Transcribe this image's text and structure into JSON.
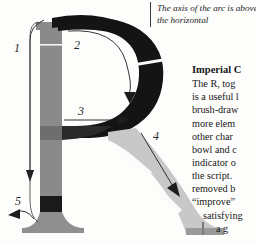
{
  "page": {
    "background_color": "#fdfdfc"
  },
  "colors": {
    "stem_gray": "#8a8a8a",
    "bowl_black": "#141414",
    "leg_light_gray": "#c8c8c8",
    "leg_mid_gray": "#b4b4b4",
    "foot_gray": "#9a9a9a",
    "outline": "#3a3a3a",
    "text": "#171717"
  },
  "caption": {
    "lines": [
      "The axis of the arc is above",
      "the horizontal"
    ]
  },
  "article": {
    "heading": "Imperial C",
    "lines": [
      {
        "text": "The R, tog",
        "indent": 0
      },
      {
        "text": "is a useful l",
        "indent": 0
      },
      {
        "text": "brush-draw",
        "indent": 0
      },
      {
        "text": "more elem",
        "indent": 0
      },
      {
        "text": "other char",
        "indent": 0
      },
      {
        "text": "bowl and c",
        "indent": 0
      },
      {
        "text": "indicator o",
        "indent": 0
      },
      {
        "text": "the script.",
        "indent": 0
      },
      {
        "text": "removed b",
        "indent": 0
      },
      {
        "text": "“improve”",
        "indent": 0
      },
      {
        "text": "satisfying",
        "indent": 1
      },
      {
        "text": "a g",
        "indent": 2
      }
    ]
  },
  "callouts": [
    {
      "id": "1",
      "label": "1",
      "note": "stem — vertical stroke with downward arrow"
    },
    {
      "id": "2",
      "label": "2",
      "note": "bowl — curved arrow tracing inside of arc"
    },
    {
      "id": "3",
      "label": "3",
      "note": "junction — horizontal arrow pointing right"
    },
    {
      "id": "4",
      "label": "4",
      "note": "leg — diagonal arrow down to the right"
    },
    {
      "id": "5",
      "label": "5",
      "note": "foot serif — curved arrow pointing left"
    }
  ],
  "letterform": {
    "glyph": "R",
    "parts": [
      {
        "name": "stem",
        "fill": "#8a8a8a"
      },
      {
        "name": "bowl",
        "fill": "#141414"
      },
      {
        "name": "leg",
        "fill": "#c8c8c8"
      },
      {
        "name": "foot-serif",
        "fill": "#9a9a9a"
      }
    ]
  }
}
